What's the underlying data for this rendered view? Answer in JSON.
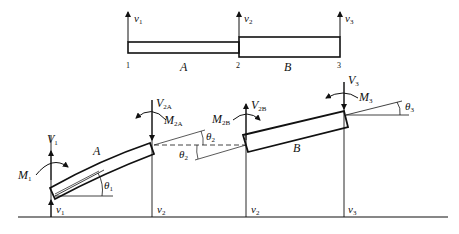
{
  "top": {
    "dofs": [
      {
        "sym": "v",
        "sub": "1"
      },
      {
        "sym": "v",
        "sub": "2"
      },
      {
        "sym": "v",
        "sub": "3"
      }
    ],
    "nodes": [
      "1",
      "2",
      "3"
    ],
    "elements": [
      "A",
      "B"
    ]
  },
  "bottom": {
    "node1": {
      "force": "V",
      "force_sub": "1",
      "moment": "M",
      "moment_sub": "1",
      "rotation": "θ",
      "rotation_sub": "1",
      "disp": "v",
      "disp_sub": "1"
    },
    "node2A": {
      "force": "V",
      "force_sub": "2A",
      "moment": "M",
      "moment_sub": "2A",
      "rotation": "θ",
      "rotation_sub": "2",
      "disp": "v",
      "disp_sub": "2"
    },
    "node2B": {
      "force": "V",
      "force_sub": "2B",
      "moment": "M",
      "moment_sub": "2B",
      "rotation": "θ",
      "rotation_sub": "2",
      "disp": "v",
      "disp_sub": "2"
    },
    "node3": {
      "force": "V",
      "force_sub": "3",
      "moment": "M",
      "moment_sub": "3",
      "rotation": "θ",
      "rotation_sub": "3",
      "disp": "v",
      "disp_sub": "3"
    },
    "elements": [
      "A",
      "B"
    ]
  },
  "colors": {
    "line": "#111111",
    "background": "#ffffff"
  }
}
